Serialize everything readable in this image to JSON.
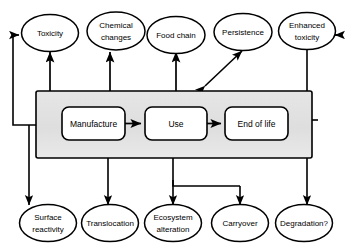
{
  "diagram": {
    "colors": {
      "stroke": "#000000",
      "panel_fill": "#e2e2e2",
      "node_fill": "#ffffff",
      "text": "#000000"
    },
    "lifecycle_stages": [
      {
        "id": "manufacture",
        "label": "Manufacture"
      },
      {
        "id": "use",
        "label": "Use"
      },
      {
        "id": "end-of-life",
        "label": "End of life"
      }
    ],
    "top_nodes": [
      {
        "id": "toxicity",
        "line1": "Toxicity",
        "line2": ""
      },
      {
        "id": "chemical-changes",
        "line1": "Chemical",
        "line2": "changes"
      },
      {
        "id": "food-chain",
        "line1": "Food chain",
        "line2": ""
      },
      {
        "id": "persistence",
        "line1": "Persistence",
        "line2": ""
      },
      {
        "id": "enhanced-toxicity",
        "line1": "Enhanced",
        "line2": "toxicity"
      }
    ],
    "bottom_nodes": [
      {
        "id": "surface-reactivity",
        "line1": "Surface",
        "line2": "reactivity"
      },
      {
        "id": "translocation",
        "line1": "Translocation",
        "line2": ""
      },
      {
        "id": "ecosystem-alteration",
        "line1": "Ecosystem",
        "line2": "alteration"
      },
      {
        "id": "carryover",
        "line1": "Carryover",
        "line2": ""
      },
      {
        "id": "degradation",
        "line1": "Degradation?",
        "line2": ""
      }
    ]
  }
}
